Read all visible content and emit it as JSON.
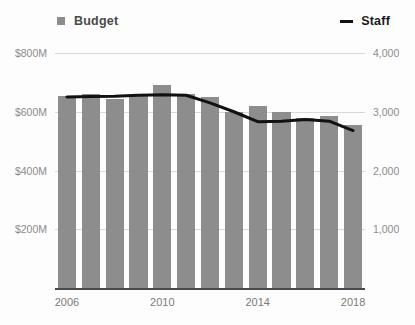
{
  "legend": {
    "budget_label": "Budget",
    "staff_label": "Staff",
    "budget_icon": "square-swatch-icon",
    "staff_icon": "line-swatch-icon"
  },
  "axes": {
    "left_ticks": [
      "$800M",
      "$600M",
      "$400M",
      "$200M"
    ],
    "right_ticks": [
      "4,000",
      "3,000",
      "2,000",
      "1,000"
    ],
    "x_ticks": [
      "2006",
      "2010",
      "2014",
      "2018"
    ]
  },
  "colors": {
    "bar": "#8d8d8d",
    "line": "#111111",
    "grid": "#d8d8d8",
    "axis_text": "#8c8c8c",
    "background": "#fdfdfd"
  },
  "chart_data": {
    "type": "bar",
    "title": "",
    "subtitle": "",
    "xlabel": "",
    "ylabel": "",
    "grid": true,
    "legend_position": "top",
    "categories": [
      2006,
      2007,
      2008,
      2009,
      2010,
      2011,
      2012,
      2013,
      2014,
      2015,
      2016,
      2017,
      2018
    ],
    "series": [
      {
        "name": "Budget",
        "type": "bar",
        "axis": "left",
        "unit": "USD millions",
        "ylim": [
          0,
          800
        ],
        "ytick_values": [
          200,
          400,
          600,
          800
        ],
        "ytick_labels": [
          "$200M",
          "$400M",
          "$600M",
          "$800M"
        ],
        "values": [
          655,
          660,
          645,
          655,
          690,
          660,
          650,
          600,
          620,
          600,
          580,
          585,
          555
        ]
      },
      {
        "name": "Staff",
        "type": "line",
        "axis": "right",
        "unit": "employees",
        "ylim": [
          0,
          4000
        ],
        "ytick_values": [
          1000,
          2000,
          3000,
          4000
        ],
        "ytick_labels": [
          "1,000",
          "2,000",
          "3,000",
          "4,000"
        ],
        "values": [
          3250,
          3260,
          3265,
          3280,
          3290,
          3280,
          3150,
          3000,
          2830,
          2840,
          2870,
          2840,
          2680
        ]
      }
    ],
    "xlim": [
      2005.5,
      2018.5
    ]
  }
}
